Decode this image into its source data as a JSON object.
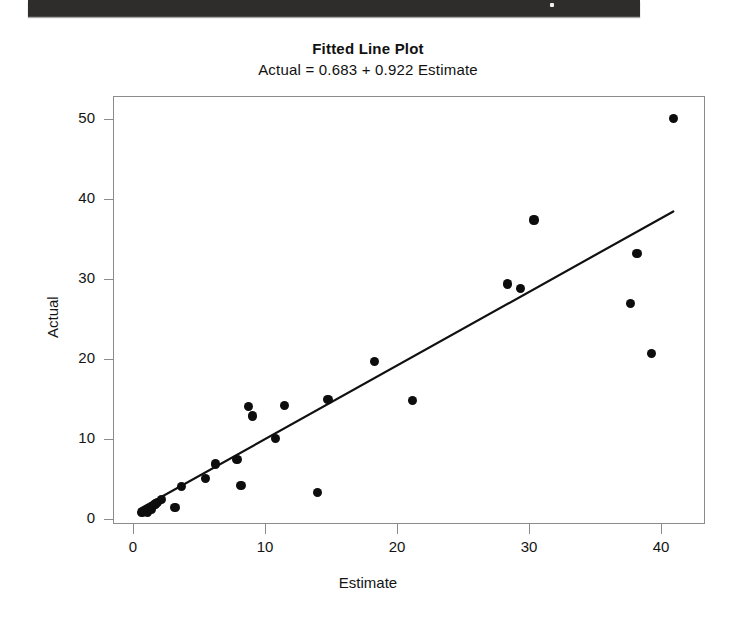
{
  "page": {
    "scan_artifact": "dark-scan-bar"
  },
  "chart_data": {
    "type": "scatter",
    "title": "Fitted Line Plot",
    "subtitle": "Actual = 0.683 + 0.922 Estimate",
    "xlabel": "Estimate",
    "ylabel": "Actual",
    "xlim": [
      -1.5,
      43.0
    ],
    "ylim": [
      -1.5,
      52.0
    ],
    "xticks": [
      0,
      10,
      20,
      30,
      40
    ],
    "yticks": [
      0,
      10,
      20,
      30,
      40,
      50
    ],
    "xtick_labels": [
      "0",
      "10",
      "20",
      "30",
      "40"
    ],
    "ytick_labels": [
      "0",
      "10",
      "20",
      "30",
      "40",
      "50"
    ],
    "grid": false,
    "legend": "none",
    "marker": "filled-circle",
    "marker_color": "#0d0d0d",
    "line_color": "#111111",
    "regression": {
      "intercept": 0.683,
      "slope": 0.922,
      "equation": "Actual = 0.683 + 0.922 Estimate",
      "x_start": 0.4,
      "x_end": 41.0,
      "y_start": 1.1,
      "y_end": 38.5
    },
    "points": [
      {
        "x": 0.6,
        "y": 0.9
      },
      {
        "x": 0.8,
        "y": 1.1
      },
      {
        "x": 1.0,
        "y": 1.0
      },
      {
        "x": 1.1,
        "y": 1.4
      },
      {
        "x": 1.3,
        "y": 1.3
      },
      {
        "x": 1.5,
        "y": 1.8
      },
      {
        "x": 1.6,
        "y": 2.0
      },
      {
        "x": 1.8,
        "y": 2.2
      },
      {
        "x": 2.1,
        "y": 2.6
      },
      {
        "x": 3.1,
        "y": 1.6
      },
      {
        "x": 3.6,
        "y": 4.2
      },
      {
        "x": 5.4,
        "y": 5.2
      },
      {
        "x": 6.2,
        "y": 7.0
      },
      {
        "x": 7.8,
        "y": 7.6
      },
      {
        "x": 8.1,
        "y": 4.3
      },
      {
        "x": 8.7,
        "y": 14.2
      },
      {
        "x": 9.0,
        "y": 13.0
      },
      {
        "x": 10.7,
        "y": 10.2
      },
      {
        "x": 11.4,
        "y": 14.3
      },
      {
        "x": 13.9,
        "y": 3.4
      },
      {
        "x": 14.7,
        "y": 15.1
      },
      {
        "x": 18.2,
        "y": 19.8
      },
      {
        "x": 21.1,
        "y": 14.9
      },
      {
        "x": 28.3,
        "y": 29.5
      },
      {
        "x": 29.3,
        "y": 28.9
      },
      {
        "x": 30.3,
        "y": 37.5
      },
      {
        "x": 37.6,
        "y": 27.1
      },
      {
        "x": 38.1,
        "y": 33.3
      },
      {
        "x": 39.2,
        "y": 20.8
      },
      {
        "x": 40.9,
        "y": 50.2
      }
    ]
  }
}
